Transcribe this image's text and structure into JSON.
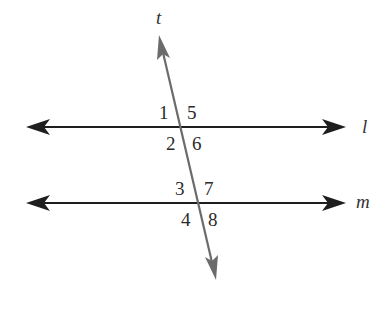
{
  "diagram": {
    "colors": {
      "parallel_lines": "#1e1e1e",
      "transversal": "#6b6b6b",
      "labels": "#2a2a2a"
    },
    "transversal": {
      "label": "t",
      "start": [
        159,
        35
      ],
      "end": [
        216,
        280
      ]
    },
    "lines": [
      {
        "label": "l",
        "y": 127,
        "x_start": 26,
        "x_end": 346,
        "label_pos": [
          362,
          133
        ]
      },
      {
        "label": "m",
        "y": 203,
        "x_start": 26,
        "x_end": 346,
        "label_pos": [
          356,
          208
        ]
      }
    ],
    "angles": [
      {
        "label": "1",
        "pos": [
          159,
          119
        ]
      },
      {
        "label": "5",
        "pos": [
          187,
          119
        ]
      },
      {
        "label": "2",
        "pos": [
          166,
          150
        ]
      },
      {
        "label": "6",
        "pos": [
          192,
          150
        ]
      },
      {
        "label": "3",
        "pos": [
          175,
          195
        ]
      },
      {
        "label": "7",
        "pos": [
          204,
          195
        ]
      },
      {
        "label": "4",
        "pos": [
          181,
          226
        ]
      },
      {
        "label": "8",
        "pos": [
          208,
          226
        ]
      }
    ]
  }
}
